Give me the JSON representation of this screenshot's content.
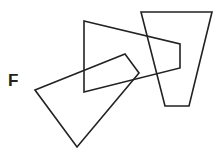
{
  "label": "F",
  "stroke_color": "#222222",
  "shapes": {
    "trapezoid": {
      "points": "141,12 212,12 189,106 165,106"
    },
    "pentagon": {
      "points": "84,21 180,44 180,68 84,92"
    },
    "quadrilateral": {
      "points": "35,90 125,54 139,73 77,147"
    }
  }
}
